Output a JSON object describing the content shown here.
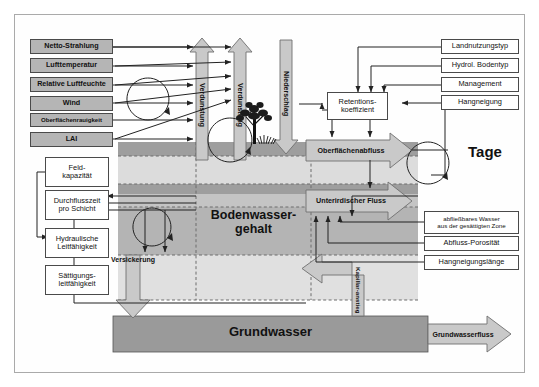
{
  "diagram": {
    "annotation_tage": "Tage",
    "colors": {
      "box_gray": "#b5b5b5",
      "arrow_gray": "#c9c9c9",
      "soil_dark": "#9e9e9e",
      "soil_mid": "#b9b9b9",
      "soil_light": "#d8d8d8",
      "soil_pale": "#e6e6e6",
      "groundwater": "#9a9a9a",
      "stroke": "#333333"
    }
  },
  "inputs_left": [
    {
      "label": "Netto-Strahlung"
    },
    {
      "label": "Lufttemperatur"
    },
    {
      "label": "Relative Luftfeuchte"
    },
    {
      "label": "Wind"
    },
    {
      "label": "Oberflächenrauigkeit"
    },
    {
      "label": "LAI"
    }
  ],
  "soil_params_left": [
    {
      "label_line1": "Feld-",
      "label_line2": "kapazität"
    },
    {
      "label_line1": "Durchflusszeit",
      "label_line2": "pro Schicht"
    },
    {
      "label_line1": "Hydraulische",
      "label_line2": "Leitfähigkeit"
    },
    {
      "label_line1": "Sättigungs-",
      "label_line2": "leitfähigkeit"
    }
  ],
  "runoff_params_right": [
    {
      "label": "Landnutzungstyp"
    },
    {
      "label": "Hydrol. Bodentyp"
    },
    {
      "label": "Management"
    },
    {
      "label": "Hangneigung"
    }
  ],
  "subsurface_params_right": [
    {
      "label_line1": "abfließbares Wasser",
      "label_line2": "aus der gesättigten Zone"
    },
    {
      "label_line1": "Abfluss-Porosität",
      "label_line2": ""
    },
    {
      "label_line1": "Hangneigungslänge",
      "label_line2": ""
    }
  ],
  "process_nodes": {
    "retention_line1": "Retentions-",
    "retention_line2": "koeffizient",
    "surface_runoff": "Oberflächenabfluss",
    "subsurface_flow": "Unterirdischer Fluss",
    "percolation": "Versickerung",
    "capillary_line1": "Kapillar-",
    "capillary_line2": "anstieg"
  },
  "flux_arrows": {
    "evaporation_1": "Verdunstung",
    "evaporation_2": "Verdunstung",
    "precipitation": "Niederschlag",
    "groundwater_flow": "Grundwasserfluss"
  },
  "storages": {
    "soil_water_line1": "Bodenwasser-",
    "soil_water_line2": "gehalt",
    "groundwater": "Grundwasser"
  }
}
